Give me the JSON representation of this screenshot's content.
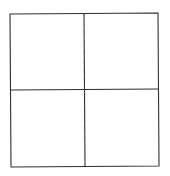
{
  "diagram": {
    "type": "grid",
    "rows": 2,
    "columns": 2,
    "line_color": "#2f2f2f",
    "background_color": "#ffffff",
    "outer_frame": {
      "top_left": [
        10,
        14
      ],
      "top_right": [
        158,
        13
      ],
      "bottom_right": [
        159,
        166
      ],
      "bottom_left": [
        11,
        167
      ]
    },
    "vertical_divider": {
      "top": [
        84,
        14
      ],
      "bottom": [
        85,
        166
      ]
    },
    "horizontal_divider": {
      "left": [
        10,
        90
      ],
      "right": [
        159,
        89
      ]
    },
    "cells": [
      {
        "row": 0,
        "col": 0,
        "label": ""
      },
      {
        "row": 0,
        "col": 1,
        "label": ""
      },
      {
        "row": 1,
        "col": 0,
        "label": ""
      },
      {
        "row": 1,
        "col": 1,
        "label": ""
      }
    ]
  }
}
